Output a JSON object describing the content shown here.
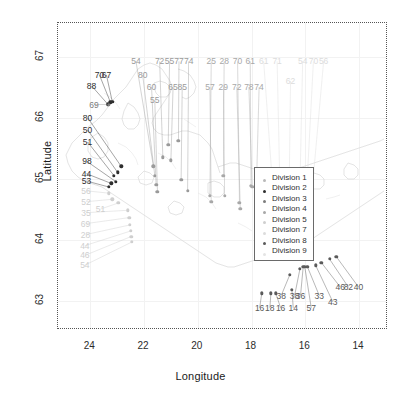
{
  "axes": {
    "xlabel": "Longitude",
    "ylabel": "Latitude",
    "xticks": [
      "24",
      "22",
      "20",
      "18",
      "16",
      "14"
    ],
    "yticks": [
      "67",
      "66",
      "65",
      "64",
      "63"
    ]
  },
  "legend": {
    "items": [
      {
        "label": "Division 1",
        "color": "#b9b9b9"
      },
      {
        "label": "Division 2",
        "color": "#2e2e2e"
      },
      {
        "label": "Division 3",
        "color": "#7d7d7d"
      },
      {
        "label": "Division 4",
        "color": "#a8a8a8"
      },
      {
        "label": "Division 5",
        "color": "#cfcfcf"
      },
      {
        "label": "Division 7",
        "color": "#dcdcdc"
      },
      {
        "label": "Division 8",
        "color": "#5a5a5a"
      },
      {
        "label": "Division 9",
        "color": "#e4e4e4"
      }
    ]
  },
  "chart_data": {
    "type": "scatter",
    "title": "",
    "xlabel": "Longitude",
    "ylabel": "Latitude",
    "xlim": [
      25.2,
      13.0
    ],
    "ylim": [
      62.55,
      67.55
    ],
    "grid": true,
    "legend_position": "center",
    "xticks": [
      24,
      22,
      20,
      18,
      16,
      14
    ],
    "yticks": [
      67,
      66,
      65,
      64,
      63
    ],
    "note": "Point labels are station values placed beside each marker with thin leader lines.",
    "points": [
      {
        "label": "88",
        "x": 23.35,
        "y": 66.22,
        "division": 2,
        "color": "#2e2e2e",
        "lx": 23.95,
        "ly": 66.52
      },
      {
        "label": "70",
        "x": 23.25,
        "y": 66.25,
        "division": 2,
        "color": "#2e2e2e",
        "lx": 23.66,
        "ly": 66.7
      },
      {
        "label": "67",
        "x": 23.18,
        "y": 66.26,
        "division": 2,
        "color": "#2e2e2e",
        "lx": 23.4,
        "ly": 66.7
      },
      {
        "label": "69",
        "x": 23.3,
        "y": 66.21,
        "division": 3,
        "color": "#7d7d7d",
        "lx": 23.86,
        "ly": 66.21
      },
      {
        "label": "80",
        "x": 22.85,
        "y": 65.2,
        "division": 2,
        "color": "#2e2e2e",
        "lx": 24.1,
        "ly": 66.0
      },
      {
        "label": "50",
        "x": 22.98,
        "y": 65.1,
        "division": 2,
        "color": "#2e2e2e",
        "lx": 24.1,
        "ly": 65.8
      },
      {
        "label": "51",
        "x": 23.12,
        "y": 65.05,
        "division": 2,
        "color": "#2e2e2e",
        "lx": 24.1,
        "ly": 65.6
      },
      {
        "label": "98",
        "x": 23.05,
        "y": 64.95,
        "division": 2,
        "color": "#2e2e2e",
        "lx": 24.12,
        "ly": 65.28
      },
      {
        "label": "44",
        "x": 23.22,
        "y": 64.92,
        "division": 2,
        "color": "#2e2e2e",
        "lx": 24.14,
        "ly": 65.08
      },
      {
        "label": "53",
        "x": 23.3,
        "y": 64.86,
        "division": 2,
        "color": "#2e2e2e",
        "lx": 24.14,
        "ly": 64.96
      },
      {
        "label": "56",
        "x": 23.3,
        "y": 64.76,
        "division": 5,
        "color": "#cfcfcf",
        "lx": 24.16,
        "ly": 64.8
      },
      {
        "label": "52",
        "x": 23.18,
        "y": 64.66,
        "division": 5,
        "color": "#cfcfcf",
        "lx": 24.16,
        "ly": 64.62
      },
      {
        "label": "51",
        "x": 22.95,
        "y": 64.6,
        "division": 5,
        "color": "#cfcfcf",
        "lx": 23.62,
        "ly": 64.5
      },
      {
        "label": "35",
        "x": 22.6,
        "y": 64.48,
        "division": 5,
        "color": "#cfcfcf",
        "lx": 24.16,
        "ly": 64.44
      },
      {
        "label": "69",
        "x": 22.55,
        "y": 64.36,
        "division": 5,
        "color": "#cfcfcf",
        "lx": 24.18,
        "ly": 64.26
      },
      {
        "label": "28",
        "x": 22.52,
        "y": 64.24,
        "division": 5,
        "color": "#cfcfcf",
        "lx": 24.18,
        "ly": 64.08
      },
      {
        "label": "44",
        "x": 22.5,
        "y": 64.14,
        "division": 5,
        "color": "#cfcfcf",
        "lx": 24.2,
        "ly": 63.9
      },
      {
        "label": "46",
        "x": 22.48,
        "y": 64.05,
        "division": 5,
        "color": "#cfcfcf",
        "lx": 24.2,
        "ly": 63.74
      },
      {
        "label": "54",
        "x": 22.45,
        "y": 63.96,
        "division": 5,
        "color": "#cfcfcf",
        "lx": 24.2,
        "ly": 63.58
      },
      {
        "label": "54",
        "x": 21.65,
        "y": 65.2,
        "division": 3,
        "color": "#9a9a9a",
        "lx": 22.3,
        "ly": 66.92
      },
      {
        "label": "80",
        "x": 21.6,
        "y": 65.05,
        "division": 3,
        "color": "#9a9a9a",
        "lx": 22.05,
        "ly": 66.7
      },
      {
        "label": "60",
        "x": 21.55,
        "y": 64.9,
        "division": 3,
        "color": "#9a9a9a",
        "lx": 21.72,
        "ly": 66.5
      },
      {
        "label": "55",
        "x": 21.5,
        "y": 64.78,
        "division": 3,
        "color": "#9a9a9a",
        "lx": 21.6,
        "ly": 66.28
      },
      {
        "label": "72",
        "x": 21.3,
        "y": 65.35,
        "division": 3,
        "color": "#9a9a9a",
        "lx": 21.42,
        "ly": 66.92
      },
      {
        "label": "55",
        "x": 21.1,
        "y": 65.55,
        "division": 3,
        "color": "#9a9a9a",
        "lx": 21.05,
        "ly": 66.92
      },
      {
        "label": "65",
        "x": 21.0,
        "y": 65.3,
        "division": 3,
        "color": "#9a9a9a",
        "lx": 20.92,
        "ly": 66.5
      },
      {
        "label": "77",
        "x": 20.72,
        "y": 65.62,
        "division": 3,
        "color": "#9a9a9a",
        "lx": 20.7,
        "ly": 66.92
      },
      {
        "label": "85",
        "x": 20.62,
        "y": 64.98,
        "division": 3,
        "color": "#9a9a9a",
        "lx": 20.58,
        "ly": 66.5
      },
      {
        "label": "74",
        "x": 20.38,
        "y": 64.8,
        "division": 3,
        "color": "#9a9a9a",
        "lx": 20.34,
        "ly": 66.92
      },
      {
        "label": "25",
        "x": 19.55,
        "y": 64.72,
        "division": 4,
        "color": "#a8a8a8",
        "lx": 19.5,
        "ly": 66.92
      },
      {
        "label": "57",
        "x": 19.5,
        "y": 64.62,
        "division": 4,
        "color": "#a8a8a8",
        "lx": 19.55,
        "ly": 66.5
      },
      {
        "label": "28",
        "x": 19.05,
        "y": 65.05,
        "division": 4,
        "color": "#a8a8a8",
        "lx": 19.02,
        "ly": 66.92
      },
      {
        "label": "29",
        "x": 19.0,
        "y": 64.72,
        "division": 4,
        "color": "#a8a8a8",
        "lx": 19.05,
        "ly": 66.5
      },
      {
        "label": "70",
        "x": 18.45,
        "y": 64.6,
        "division": 4,
        "color": "#a8a8a8",
        "lx": 18.52,
        "ly": 66.92
      },
      {
        "label": "72",
        "x": 18.42,
        "y": 64.5,
        "division": 4,
        "color": "#a8a8a8",
        "lx": 18.55,
        "ly": 66.5
      },
      {
        "label": "61",
        "x": 18.02,
        "y": 64.88,
        "division": 4,
        "color": "#a8a8a8",
        "lx": 18.05,
        "ly": 66.92
      },
      {
        "label": "78",
        "x": 17.98,
        "y": 64.86,
        "division": 4,
        "color": "#a8a8a8",
        "lx": 18.1,
        "ly": 66.5
      },
      {
        "label": "74",
        "x": 17.82,
        "y": 64.86,
        "division": 4,
        "color": "#a8a8a8",
        "lx": 17.72,
        "ly": 66.5
      },
      {
        "label": "61",
        "x": 17.25,
        "y": 65.08,
        "division": 7,
        "color": "#dcdcdc",
        "lx": 17.55,
        "ly": 66.92
      },
      {
        "label": "71",
        "x": 16.95,
        "y": 64.95,
        "division": 7,
        "color": "#dcdcdc",
        "lx": 17.05,
        "ly": 66.92
      },
      {
        "label": "62",
        "x": 16.6,
        "y": 64.9,
        "division": 7,
        "color": "#dcdcdc",
        "lx": 16.55,
        "ly": 66.6
      },
      {
        "label": "54",
        "x": 16.2,
        "y": 64.9,
        "division": 7,
        "color": "#dcdcdc",
        "lx": 16.1,
        "ly": 66.92
      },
      {
        "label": "70",
        "x": 15.95,
        "y": 64.82,
        "division": 7,
        "color": "#dcdcdc",
        "lx": 15.7,
        "ly": 66.92
      },
      {
        "label": "56",
        "x": 15.75,
        "y": 64.8,
        "division": 7,
        "color": "#dcdcdc",
        "lx": 15.32,
        "ly": 66.92
      },
      {
        "label": "16",
        "x": 17.62,
        "y": 63.12,
        "division": 8,
        "color": "#5a5a5a",
        "lx": 17.7,
        "ly": 62.88
      },
      {
        "label": "18",
        "x": 17.28,
        "y": 63.12,
        "division": 8,
        "color": "#5a5a5a",
        "lx": 17.32,
        "ly": 62.88
      },
      {
        "label": "16",
        "x": 17.1,
        "y": 63.12,
        "division": 8,
        "color": "#5a5a5a",
        "lx": 16.92,
        "ly": 62.88
      },
      {
        "label": "14",
        "x": 16.5,
        "y": 63.18,
        "division": 8,
        "color": "#5a5a5a",
        "lx": 16.45,
        "ly": 62.88
      },
      {
        "label": "38",
        "x": 16.58,
        "y": 63.42,
        "division": 8,
        "color": "#5a5a5a",
        "lx": 16.9,
        "ly": 63.08
      },
      {
        "label": "38",
        "x": 16.2,
        "y": 63.52,
        "division": 8,
        "color": "#5a5a5a",
        "lx": 16.4,
        "ly": 63.08
      },
      {
        "label": "36",
        "x": 16.08,
        "y": 63.55,
        "division": 8,
        "color": "#5a5a5a",
        "lx": 16.18,
        "ly": 63.08
      },
      {
        "label": "57",
        "x": 16.02,
        "y": 63.55,
        "division": 8,
        "color": "#5a5a5a",
        "lx": 15.78,
        "ly": 62.88
      },
      {
        "label": "33",
        "x": 15.92,
        "y": 63.55,
        "division": 8,
        "color": "#5a5a5a",
        "lx": 15.48,
        "ly": 63.08
      },
      {
        "label": "43",
        "x": 15.62,
        "y": 63.58,
        "division": 8,
        "color": "#5a5a5a",
        "lx": 14.98,
        "ly": 62.98
      },
      {
        "label": "46",
        "x": 15.4,
        "y": 63.62,
        "division": 8,
        "color": "#5a5a5a",
        "lx": 14.7,
        "ly": 63.22
      },
      {
        "label": "82",
        "x": 15.1,
        "y": 63.68,
        "division": 8,
        "color": "#5a5a5a",
        "lx": 14.4,
        "ly": 63.22
      },
      {
        "label": "40",
        "x": 14.85,
        "y": 63.72,
        "division": 8,
        "color": "#5a5a5a",
        "lx": 14.02,
        "ly": 63.22
      }
    ]
  }
}
